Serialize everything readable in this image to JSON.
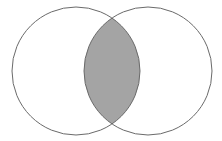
{
  "diagram": {
    "type": "venn",
    "sets": [
      {
        "name": "left-set",
        "cx": 76,
        "cy": 71,
        "r": 64
      },
      {
        "name": "right-set",
        "cx": 148,
        "cy": 71,
        "r": 64
      }
    ],
    "highlight": "intersection",
    "colors": {
      "background": "#ffffff",
      "stroke": "#6a6a6a",
      "intersection_fill": "#a4a4a4",
      "intersection_stroke": "#4a4a4a"
    }
  }
}
